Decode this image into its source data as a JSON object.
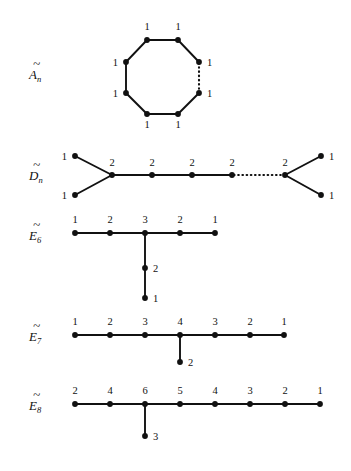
{
  "figure": {
    "background_color": "#ffffff",
    "ink_color": "#111111"
  },
  "rows": [
    {
      "id": "A-tilde-n",
      "label_base": "A",
      "label_sub": "n",
      "label_tilde": "~",
      "shape": "cycle",
      "node_count": 8,
      "marks": [
        "1",
        "1",
        "1",
        "1",
        "1",
        "1",
        "1",
        "1"
      ],
      "dotted_edges": 1
    },
    {
      "id": "D-tilde-n",
      "label_base": "D",
      "label_sub": "n",
      "label_tilde": "~",
      "shape": "double-fork-chain",
      "left_fork_marks": [
        "1",
        "1"
      ],
      "chain_marks": [
        "2",
        "2",
        "2",
        "2",
        "2"
      ],
      "right_fork_marks": [
        "1",
        "1"
      ],
      "dotted_edges": 1
    },
    {
      "id": "E-tilde-6",
      "label_base": "E",
      "label_sub": "6",
      "label_tilde": "~",
      "shape": "T-chain",
      "chain_marks": [
        "1",
        "2",
        "3",
        "2",
        "1"
      ],
      "branch_marks": [
        "2",
        "1"
      ],
      "branch_at_index": 2
    },
    {
      "id": "E-tilde-7",
      "label_base": "E",
      "label_sub": "7",
      "label_tilde": "~",
      "shape": "T-chain",
      "chain_marks": [
        "1",
        "2",
        "3",
        "4",
        "3",
        "2",
        "1"
      ],
      "branch_marks": [
        "2"
      ],
      "branch_at_index": 3
    },
    {
      "id": "E-tilde-8",
      "label_base": "E",
      "label_sub": "8",
      "label_tilde": "~",
      "shape": "T-chain",
      "chain_marks": [
        "2",
        "4",
        "6",
        "5",
        "4",
        "3",
        "2",
        "1"
      ],
      "branch_marks": [
        "3"
      ],
      "branch_at_index": 2
    }
  ]
}
